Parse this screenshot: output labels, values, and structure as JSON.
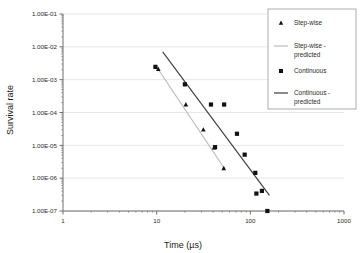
{
  "chart_data": {
    "type": "scatter",
    "title": "",
    "xlabel": "Time (µs)",
    "ylabel": "Survival rate",
    "xscale": "log",
    "yscale": "log",
    "xlim": [
      1,
      1000
    ],
    "ylim": [
      1e-07,
      0.1
    ],
    "grid": "horizontal-major",
    "legend_position": "top-right",
    "xticks": [
      {
        "value": 1,
        "label": "1"
      },
      {
        "value": 10,
        "label": "10"
      },
      {
        "value": 100,
        "label": "100"
      },
      {
        "value": 1000,
        "label": "1000"
      }
    ],
    "yticks": [
      {
        "value": 0.1,
        "label": "1.00E-01"
      },
      {
        "value": 0.01,
        "label": "1.00E-02"
      },
      {
        "value": 0.001,
        "label": "1.00E-03"
      },
      {
        "value": 0.0001,
        "label": "1.00E-04"
      },
      {
        "value": 1e-05,
        "label": "1.00E-05"
      },
      {
        "value": 1e-06,
        "label": "1.00E-06"
      },
      {
        "value": 1e-07,
        "label": "1.00E-07"
      }
    ],
    "series": [
      {
        "name": "Step-wise",
        "kind": "scatter",
        "marker": "triangle",
        "color": "#111111",
        "points": [
          {
            "x": 10.4,
            "y": 0.0021
          },
          {
            "x": 20.5,
            "y": 0.000175
          },
          {
            "x": 31.5,
            "y": 3e-05
          },
          {
            "x": 41.0,
            "y": 8.5e-06
          },
          {
            "x": 52.0,
            "y": 2e-06
          }
        ]
      },
      {
        "name": "Step-wise - predicted",
        "kind": "line",
        "color": "#b9b9b9",
        "width": 1.1,
        "endpoints": [
          {
            "x": 9.6,
            "y": 0.0029
          },
          {
            "x": 54.0,
            "y": 1.8e-06
          }
        ]
      },
      {
        "name": "Continuous",
        "kind": "scatter",
        "marker": "square",
        "color": "#111111",
        "points": [
          {
            "x": 9.7,
            "y": 0.00245
          },
          {
            "x": 20.0,
            "y": 0.00072
          },
          {
            "x": 38.0,
            "y": 0.000175
          },
          {
            "x": 52.5,
            "y": 0.000175
          },
          {
            "x": 42.0,
            "y": 8.8e-06
          },
          {
            "x": 72.0,
            "y": 2.25e-05
          },
          {
            "x": 87.0,
            "y": 5.2e-06
          },
          {
            "x": 113.0,
            "y": 1.45e-06
          },
          {
            "x": 116.0,
            "y": 3.4e-07
          },
          {
            "x": 133.0,
            "y": 4.1e-07
          },
          {
            "x": 152.0,
            "y": 1e-07
          }
        ]
      },
      {
        "name": "Continuous - predicted",
        "kind": "line",
        "color": "#3a3a3a",
        "width": 1.1,
        "endpoints": [
          {
            "x": 11.6,
            "y": 0.007
          },
          {
            "x": 160.0,
            "y": 3e-07
          }
        ]
      }
    ],
    "legend": [
      {
        "label": "Step-wise",
        "swatch": "triangle",
        "color": "#111111"
      },
      {
        "label": "Step-wise - predicted",
        "swatch": "line",
        "color": "#b9b9b9"
      },
      {
        "label": "Continuous",
        "swatch": "square",
        "color": "#111111"
      },
      {
        "label": "Continuous - predicted",
        "swatch": "line",
        "color": "#3a3a3a"
      }
    ]
  },
  "colors": {
    "axis": "#6e6e6e",
    "grid": "#e2e2e2",
    "text": "#2b2b2b",
    "legend_border": "#9a9a9a",
    "background": "#ffffff"
  }
}
